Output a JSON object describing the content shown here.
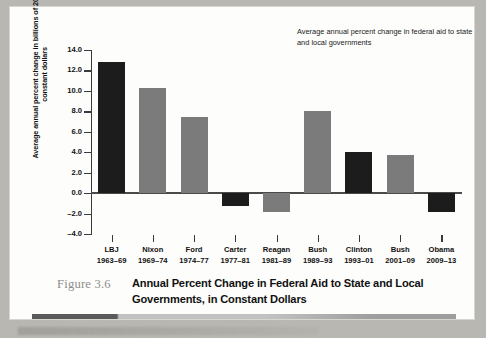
{
  "figure": {
    "number_label": "Figure 3.6",
    "caption": "Annual Percent Change in Federal Aid to State and Local Governments, in Constant Dollars"
  },
  "legend_note": "Average annual percent change in federal aid to state and local governments",
  "colors": {
    "dark_bar": "#1c1c1c",
    "gray_bar": "#7b7b7b",
    "axis": "#3b3b3b",
    "card_background": "#fdfdfb",
    "page_background": "#b9b7b2",
    "figure_number": "#8d8d8d"
  },
  "chart_data": {
    "type": "bar",
    "title": "Annual Percent Change in Federal Aid to State and Local Governments, in Constant Dollars",
    "xlabel": "",
    "ylabel": "Average annual percent change in billions of 2005 constant dollars",
    "ylim": [
      -4.0,
      14.0
    ],
    "ytick_values": [
      14.0,
      12.0,
      10.0,
      8.0,
      6.0,
      4.0,
      2.0,
      0.0,
      -2.0,
      -4.0
    ],
    "ytick_labels": [
      "14.0",
      "12.0",
      "10.0",
      "8.0",
      "6.0",
      "4.0",
      "2.0",
      "0.0",
      "-2.0",
      "-4.0"
    ],
    "grid": false,
    "legend_position": "top-right",
    "annotation": "Average annual percent change in federal aid to state and local governments",
    "categories": [
      "LBJ 1963-69",
      "Nixon 1969-74",
      "Ford 1974-77",
      "Carter 1977-81",
      "Reagan 1981-89",
      "Bush 1989-93",
      "Clinton 1993-01",
      "Bush 2001-09",
      "Obama 2009-13"
    ],
    "values": [
      12.8,
      10.3,
      7.4,
      -1.3,
      -1.8,
      8.0,
      4.0,
      3.7,
      -1.8
    ],
    "bar_colors": [
      "dark",
      "gray",
      "gray",
      "dark",
      "gray",
      "gray",
      "dark",
      "gray",
      "dark"
    ]
  },
  "bars": [
    {
      "name": "LBJ",
      "years": "1963–69",
      "value": 12.8,
      "color": "dark"
    },
    {
      "name": "Nixon",
      "years": "1969–74",
      "value": 10.3,
      "color": "gray"
    },
    {
      "name": "Ford",
      "years": "1974–77",
      "value": 7.4,
      "color": "gray"
    },
    {
      "name": "Carter",
      "years": "1977–81",
      "value": -1.3,
      "color": "dark"
    },
    {
      "name": "Reagan",
      "years": "1981–89",
      "value": -1.8,
      "color": "gray"
    },
    {
      "name": "Bush",
      "years": "1989–93",
      "value": 8.0,
      "color": "gray"
    },
    {
      "name": "Clinton",
      "years": "1993–01",
      "value": 4.0,
      "color": "dark"
    },
    {
      "name": "Bush",
      "years": "2001–09",
      "value": 3.7,
      "color": "gray"
    },
    {
      "name": "Obama",
      "years": "2009–13",
      "value": -1.8,
      "color": "dark"
    }
  ]
}
